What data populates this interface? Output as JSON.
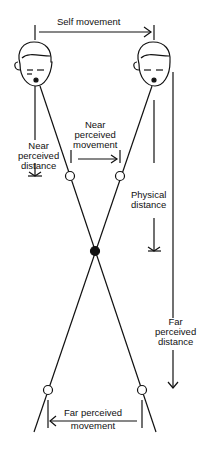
{
  "labels": {
    "self_movement": "Self movement",
    "near_perceived_distance": [
      "Near",
      "perceived",
      "distance"
    ],
    "near_perceived_movement": [
      "Near",
      "perceived",
      "movement"
    ],
    "physical_distance": [
      "Physical",
      "distance"
    ],
    "far_perceived_distance": [
      "Far",
      "perceived",
      "distance"
    ],
    "far_perceived_movement": [
      "Far perceived",
      "movement"
    ]
  },
  "colors": {
    "ink": "#111111",
    "background": "#ffffff"
  }
}
